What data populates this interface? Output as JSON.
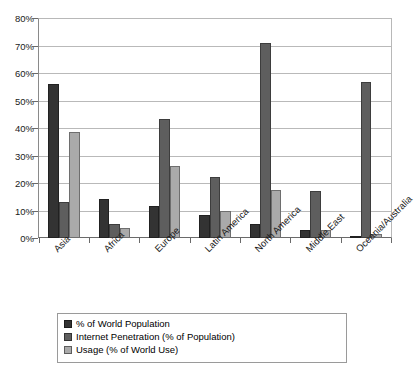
{
  "chart_data": {
    "type": "bar",
    "title": "",
    "xlabel": "",
    "ylabel": "",
    "ylim": [
      0,
      80
    ],
    "ytick_labels": [
      "80%",
      "70%",
      "60%",
      "50%",
      "40%",
      "30%",
      "20%",
      "10%",
      "0%"
    ],
    "ytick_values": [
      80,
      70,
      60,
      50,
      40,
      30,
      20,
      10,
      0
    ],
    "grid": true,
    "legend_position": "bottom",
    "categories": [
      "Asia",
      "Africa",
      "Europe",
      "Latin America",
      "North America",
      "Middle East",
      "Oceania/Australia"
    ],
    "series": [
      {
        "name": "% of World Population",
        "color": "#333333",
        "values": [
          56.3,
          14.2,
          11.7,
          8.5,
          5.1,
          3.0,
          0.5
        ]
      },
      {
        "name": "Internet Penetration (% of Population)",
        "color": "#5e5e5e",
        "values": [
          13.0,
          5.3,
          43.4,
          22.2,
          71.1,
          17.0,
          57.1
        ]
      },
      {
        "name": "Usage (% of World Use)",
        "color": "#aaaaaa",
        "values": [
          38.7,
          3.5,
          26.4,
          9.9,
          17.5,
          2.9,
          1.5
        ]
      }
    ]
  },
  "legend": {
    "entries": [
      "% of World Population",
      "Internet Penetration (% of Population)",
      "Usage (% of World Use)"
    ]
  }
}
